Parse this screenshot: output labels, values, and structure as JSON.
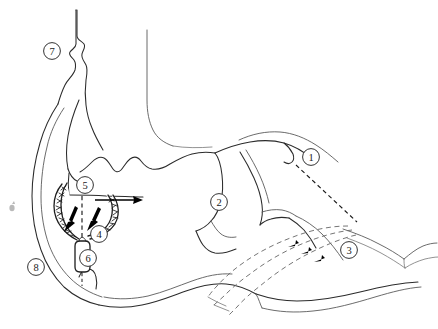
{
  "figure": {
    "alt_description": "Black and white medical line drawing of a cardiac / vascular cross-section with an implanted mesh occluder device, numbered callouts and flow arrows",
    "background_color": "#ffffff",
    "outline_color": "#2b2b2b",
    "device_color": "#1d1d1d",
    "flow_color": "#6e6e6e",
    "width": 438,
    "height": 329
  },
  "callouts": [
    {
      "id": "callout-1",
      "label": "1",
      "cx": 311,
      "cy": 157,
      "r": 8.4
    },
    {
      "id": "callout-2",
      "label": "2",
      "cx": 219,
      "cy": 202,
      "r": 8.4
    },
    {
      "id": "callout-3",
      "label": "3",
      "cx": 349,
      "cy": 250,
      "r": 8.4
    },
    {
      "id": "callout-4",
      "label": "4",
      "cx": 99,
      "cy": 234,
      "r": 8.4
    },
    {
      "id": "callout-5",
      "label": "5",
      "cx": 85,
      "cy": 185,
      "r": 8.4
    },
    {
      "id": "callout-6",
      "label": "6",
      "cx": 88,
      "cy": 258,
      "r": 8.4
    },
    {
      "id": "callout-7",
      "label": "7",
      "cx": 52,
      "cy": 51,
      "r": 8.4
    },
    {
      "id": "callout-8",
      "label": "8",
      "cx": 36,
      "cy": 267,
      "r": 8.4
    }
  ],
  "annotations": {
    "solid_flow_arrow": {
      "name": "main-flow-arrow",
      "description": "Solid horizontal arrow indicating direction of flow through the device",
      "from_x": 95,
      "from_y": 200,
      "to_x": 143,
      "to_y": 200
    },
    "device_arrows": [
      {
        "name": "device-arrow-left",
        "description": "Arrow pointing down-left into the mesh wall"
      },
      {
        "name": "device-arrow-right",
        "description": "Arrow pointing down-left from the right mesh wall"
      }
    ],
    "dashed_flow_lines": [
      {
        "name": "dashed-flow-line-outer",
        "description": "Outer curved dashed flow path with arrowhead"
      },
      {
        "name": "dashed-flow-line-middle",
        "description": "Middle curved dashed flow path with arrowhead"
      },
      {
        "name": "dashed-flow-line-inner",
        "description": "Inner curved dashed flow path with arrowhead"
      }
    ],
    "leader_lines": [
      {
        "name": "leader-line-callout-1",
        "description": "Dashed leader from callout 1 down to the vessel junction"
      },
      {
        "name": "leader-line-callout-5",
        "description": "Vertical dashed leader from callout 5 region down to the device"
      },
      {
        "name": "leader-line-callout-6",
        "description": "Short dashed leader from device base to callout 6"
      }
    ]
  },
  "structures": [
    {
      "name": "outer-wall",
      "description": "Outer body/chamber wall, heavy contour on the left and bottom"
    },
    {
      "name": "upper-vessel-trunk",
      "description": "Vertical vessel trunk rising to the top of the frame"
    },
    {
      "name": "secondary-vessel-trunk",
      "description": "Second vertical vessel descending from top right"
    },
    {
      "name": "chamber-cavity",
      "description": "Large central chamber cavity"
    },
    {
      "name": "valve-leaflets",
      "description": "Scalloped leaflet structures at the chamber roof"
    },
    {
      "name": "right-branch-vessels",
      "description": "Branching vessels extending to the right edge"
    },
    {
      "name": "lower-outflow",
      "description": "Lower outflow channel running to the right edge"
    },
    {
      "name": "mesh-occluder-device",
      "description": "Double-disc braided mesh occluder with central waist and stem"
    }
  ]
}
